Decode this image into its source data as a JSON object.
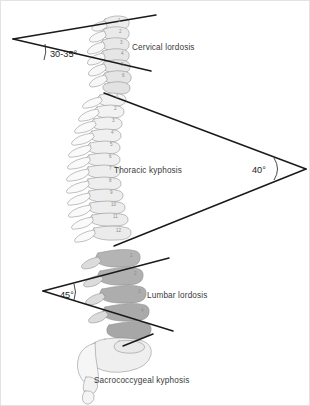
{
  "figure": {
    "background_color": "#ffffff",
    "border_color": "#e3e3e3"
  },
  "regions": [
    {
      "key": "cervical",
      "label": "Cervical lordosis",
      "label_x": 131,
      "label_y": 49,
      "angle_text": "30-35°",
      "angle_x": 42,
      "angle_y": 53,
      "vertebra_numbers": [
        "1",
        "2",
        "3",
        "4",
        "5",
        "6"
      ],
      "body_fill": "#e9e9e9"
    },
    {
      "key": "thoracic",
      "label": "Thoracic kyphosis",
      "label_x": 113,
      "label_y": 172,
      "angle_text": "40°",
      "angle_x": 256,
      "angle_y": 172,
      "vertebra_numbers": [
        "1",
        "2",
        "3",
        "4",
        "5",
        "6",
        "7",
        "8",
        "9",
        "10",
        "11",
        "12"
      ],
      "body_fill": "#f4f4f4"
    },
    {
      "key": "lumbar",
      "label": "Lumbar lordosis",
      "label_x": 146,
      "label_y": 297,
      "angle_text": "45°",
      "angle_x": 63,
      "angle_y": 294,
      "vertebra_numbers": [
        "1",
        "2",
        "3",
        "4"
      ],
      "body_fill": "#b0b0b0"
    },
    {
      "key": "sacrococcygeal",
      "label": "Sacrococcygeal kyphosis",
      "label_x": 93,
      "label_y": 382,
      "angle_text": "",
      "vertebra_numbers": [],
      "body_fill": "#eeeeee"
    }
  ],
  "colors": {
    "measure_line": "#1a1a1a",
    "bone_outline": "#8d8d8d",
    "label_text": "#3a3a3a",
    "angle_text": "#1c1c1c",
    "number_text": "#8c8c8c"
  },
  "measure_lines": {
    "cervical_upper": {
      "x1": 12,
      "y1": 38,
      "x2": 155,
      "y2": 14
    },
    "cervical_lower": {
      "x1": 12,
      "y1": 38,
      "x2": 150,
      "y2": 70
    },
    "thoracic_upper": {
      "x1": 103,
      "y1": 92,
      "x2": 305,
      "y2": 168
    },
    "thoracic_lower": {
      "x1": 113,
      "y1": 245,
      "x2": 305,
      "y2": 168
    },
    "lumbar_upper": {
      "x1": 42,
      "y1": 290,
      "x2": 168,
      "y2": 257
    },
    "lumbar_lower": {
      "x1": 42,
      "y1": 290,
      "x2": 172,
      "y2": 330
    }
  }
}
